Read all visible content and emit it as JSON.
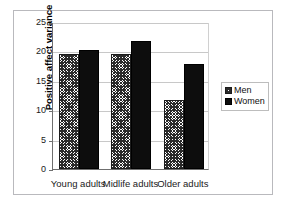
{
  "chart_data": {
    "type": "bar",
    "title": "",
    "xlabel": "",
    "ylabel": "Positive affect variance",
    "categories": [
      "Young adults",
      "Midlife adults",
      "Older adults"
    ],
    "series": [
      {
        "name": "Men",
        "values": [
          19.5,
          19.5,
          11.8
        ],
        "pattern": "crosshatch",
        "color": "#ffffff"
      },
      {
        "name": "Women",
        "values": [
          20.3,
          21.8,
          17.8
        ],
        "pattern": "solid",
        "color": "#0d0d0d"
      }
    ],
    "ylim": [
      0,
      25
    ],
    "yticks": [
      0,
      5,
      10,
      15,
      20,
      25
    ],
    "ytick_labels": [
      "0",
      "5",
      "10",
      "15",
      "20",
      "25"
    ],
    "grid": true,
    "legend_position": "right",
    "legend_entries": [
      "Men",
      "Women"
    ],
    "frame": true
  }
}
